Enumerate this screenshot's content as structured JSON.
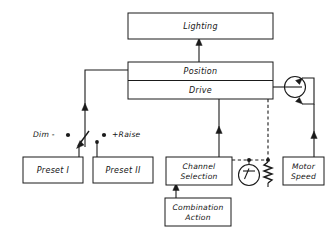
{
  "diagram": {
    "colors": {
      "line": "#1a1a1a",
      "background": "#ffffff",
      "text": "#141414"
    },
    "blocks": {
      "lighting": {
        "label": "Lighting"
      },
      "position": {
        "label": "Position"
      },
      "drive": {
        "label": "Drive"
      },
      "preset_one": {
        "label": "Preset I"
      },
      "preset_two": {
        "label": "Preset II"
      },
      "channel_selection_line1": {
        "label": "Channel"
      },
      "channel_selection_line2": {
        "label": "Selection"
      },
      "combination_action_line1": {
        "label": "Combination"
      },
      "combination_action_line2": {
        "label": "Action"
      },
      "motor_speed_line1": {
        "label": "Motor"
      },
      "motor_speed_line2": {
        "label": "Speed"
      }
    },
    "annotations": {
      "dim": "Dim -",
      "raise": "+Raise"
    },
    "symbols": {
      "motor": "motor-circle-symbol",
      "meter": "meter-gauge-symbol",
      "potentiometer": "potentiometer-zigzag-symbol",
      "switch": "selector-switch-symbol",
      "contact_dim": "contact-dot-dim",
      "contact_raise": "contact-dot-raise"
    }
  }
}
